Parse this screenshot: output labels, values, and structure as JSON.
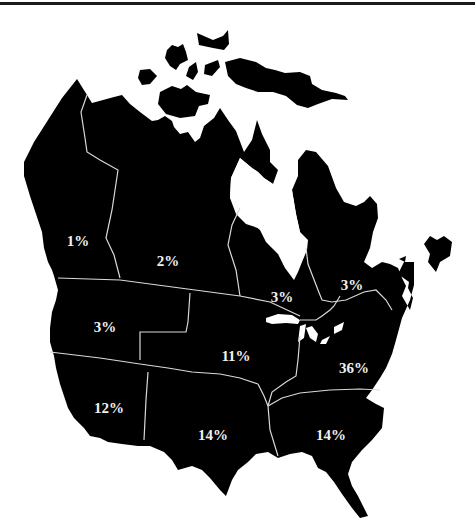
{
  "map": {
    "title": "",
    "subject": "North America regional share map",
    "fill_color": "#000000",
    "border_color": "#d9d9d9",
    "label_color": "#f0f0f0",
    "regions": [
      {
        "id": "bc-yukon",
        "label": "1%",
        "x": 78,
        "y": 241
      },
      {
        "id": "prairie-north",
        "label": "2%",
        "x": 168,
        "y": 262
      },
      {
        "id": "ontario",
        "label": "3%",
        "x": 282,
        "y": 298
      },
      {
        "id": "quebec-atlantic",
        "label": "3%",
        "x": 352,
        "y": 287
      },
      {
        "id": "pacific-northwest",
        "label": "3%",
        "x": 105,
        "y": 329
      },
      {
        "id": "midwest-plains",
        "label": "11%",
        "x": 236,
        "y": 357
      },
      {
        "id": "northeast",
        "label": "36%",
        "x": 354,
        "y": 369
      },
      {
        "id": "southwest",
        "label": "12%",
        "x": 109,
        "y": 409
      },
      {
        "id": "south-central",
        "label": "14%",
        "x": 213,
        "y": 436
      },
      {
        "id": "southeast",
        "label": "14%",
        "x": 331,
        "y": 436
      }
    ]
  }
}
